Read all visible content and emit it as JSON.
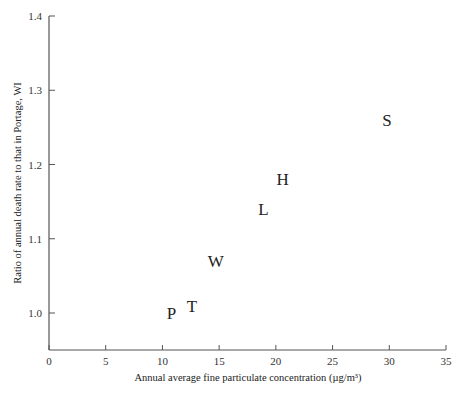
{
  "chart_data": {
    "type": "scatter",
    "title": "",
    "xlabel": "Annual average fine particulate concentration (µg/m³)",
    "ylabel": "Ratio of annual death rate to that in Portage, WI",
    "xlim": [
      0,
      35
    ],
    "ylim": [
      0.95,
      1.4
    ],
    "xticks": [
      0,
      5,
      10,
      15,
      20,
      25,
      30,
      35
    ],
    "yticks": [
      1.0,
      1.1,
      1.2,
      1.3,
      1.4
    ],
    "xtick_labels": [
      "0",
      "5",
      "10",
      "15",
      "20",
      "25",
      "30",
      "35"
    ],
    "ytick_labels": [
      "1.0",
      "1.1",
      "1.2",
      "1.3",
      "1.4"
    ],
    "grid": false,
    "legend": null,
    "points": [
      {
        "label": "P",
        "x": 10.8,
        "y": 1.0
      },
      {
        "label": "T",
        "x": 12.6,
        "y": 1.01
      },
      {
        "label": "W",
        "x": 14.7,
        "y": 1.07
      },
      {
        "label": "L",
        "x": 18.9,
        "y": 1.14
      },
      {
        "label": "H",
        "x": 20.6,
        "y": 1.18
      },
      {
        "label": "S",
        "x": 29.8,
        "y": 1.26
      }
    ]
  }
}
